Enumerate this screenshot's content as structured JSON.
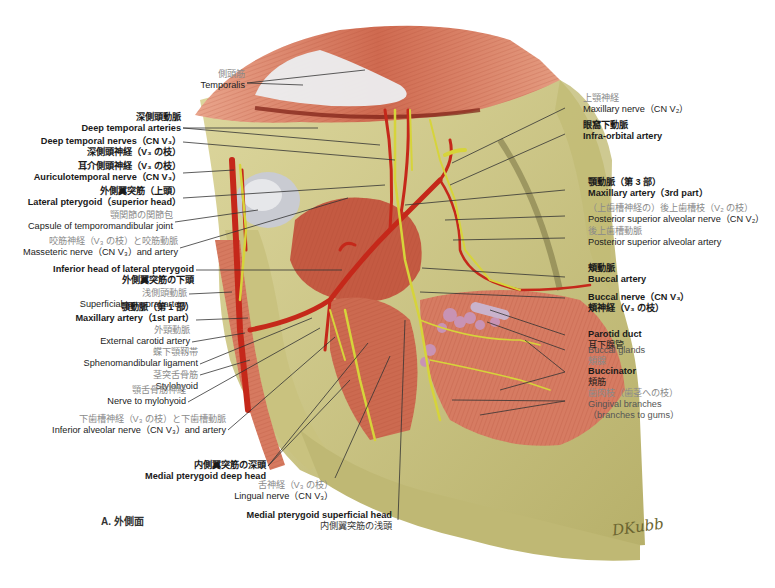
{
  "figure": {
    "caption": "A. 外側面",
    "signature": "DKubb",
    "title_hint": "Lateral view of infratemporal fossa: maxillary artery, mandibular nerve branches, pterygoid muscles"
  },
  "labels_left": [
    {
      "id": "temporalis",
      "jp": "側頭筋",
      "en": "Temporalis",
      "style": "normal"
    },
    {
      "id": "deep-temporal-arteries",
      "jp": "深側頭動脈",
      "en": "Deep temporal arteries",
      "style": "bold"
    },
    {
      "id": "deep-temporal-nerves",
      "en": "Deep temporal nerves（CN V₃）",
      "jp": "深側頭神経（V₃ の枝）",
      "style": "bold"
    },
    {
      "id": "auriculotemporal-nerve",
      "jp": "耳介側頭神経（V₃ の枝）",
      "en": "Auriculotemporal nerve（CN V₃）",
      "style": "bold"
    },
    {
      "id": "lateral-pterygoid-superior",
      "jp": "外側翼突筋（上頭）",
      "en": "Lateral pterygoid（superior head）",
      "style": "bold"
    },
    {
      "id": "tmj-capsule",
      "jp": "顎関節の関節包",
      "en": "Capsule of temporomandibular joint",
      "style": "normal"
    },
    {
      "id": "masseteric-nerve-artery",
      "jp": "咬筋神経（V₃ の枝）と咬筋動脈",
      "en": "Masseteric nerve（CN V₃）and artery",
      "style": "normal"
    },
    {
      "id": "lateral-pterygoid-inferior",
      "en": "Inferior head of lateral pterygoid",
      "jp": "外側翼突筋の下頭",
      "style": "bold"
    },
    {
      "id": "superficial-temporal-artery",
      "jp": "浅側頭動脈",
      "en": "Superficial temporal artery",
      "style": "inline"
    },
    {
      "id": "maxillary-artery-1st",
      "jp": "顎動脈（第 1 部）",
      "en": "Maxillary artery（1st part）",
      "style": "bold"
    },
    {
      "id": "external-carotid",
      "jp": "外頸動脈",
      "en": "External carotid artery",
      "style": "normal"
    },
    {
      "id": "sphenomandibular-ligament",
      "jp": "蝶下顎靱帯",
      "en": "Sphenomandibular ligament",
      "style": "normal"
    },
    {
      "id": "stylohyoid",
      "jp": "茎突舌骨筋",
      "en": "Stylohyoid",
      "style": "inline"
    },
    {
      "id": "nerve-to-mylohyoid",
      "jp": "顎舌骨筋神経",
      "en": "Nerve to mylohyoid",
      "style": "normal"
    },
    {
      "id": "inferior-alveolar",
      "jp": "下歯槽神経（V₃ の枝）と下歯槽動脈",
      "en": "Inferior alveolar nerve（CN V₃）and artery",
      "style": "normal"
    },
    {
      "id": "medial-pterygoid-deep",
      "jp": "内側翼突筋の深頭",
      "en": "Medial pterygoid deep head",
      "style": "inline-bold"
    },
    {
      "id": "lingual-nerve",
      "jp": "舌神経（V₃ の枝）",
      "en": "Lingual nerve（CN V₃）",
      "style": "inline"
    }
  ],
  "labels_bottom": [
    {
      "id": "medial-pterygoid-superficial",
      "en": "Medial pterygoid superficial head",
      "jp": "内側翼突筋の浅頭",
      "style": "bold-en"
    }
  ],
  "labels_right": [
    {
      "id": "maxillary-nerve",
      "jp": "上顎神経",
      "en": "Maxillary nerve（CN V₂）",
      "style": "normal"
    },
    {
      "id": "infraorbital-artery",
      "jp": "眼窩下動脈",
      "en": "Infra-orbital artery",
      "style": "bold"
    },
    {
      "id": "maxillary-artery-3rd",
      "jp": "顎動脈（第 3 部）",
      "en": "Maxillary artery（3rd part）",
      "style": "bold"
    },
    {
      "id": "posterior-superior-alveolar-nerve",
      "jp": "（上歯槽神経の）後上歯槽枝（V₂ の枝）",
      "en": "Posterior superior alveolar nerve（CN V₂）",
      "style": "normal"
    },
    {
      "id": "posterior-superior-alveolar-artery",
      "jp": "後上歯槽動脈",
      "en": "Posterior superior alveolar artery",
      "style": "normal"
    },
    {
      "id": "buccal-artery",
      "jp": "頬動脈",
      "en": "Buccal artery",
      "style": "bold"
    },
    {
      "id": "buccal-nerve",
      "en": "Buccal nerve（CN V₃）",
      "jp": "頬神経（V₃ の枝）",
      "style": "bold"
    },
    {
      "id": "parotid-duct",
      "en": "Parotid duct",
      "jp": "耳下腺管",
      "style": "inline-bold"
    },
    {
      "id": "buccal-glands",
      "en": "Buccal glands",
      "jp": "頬腺",
      "style": "inline"
    },
    {
      "id": "buccinator",
      "en": "Buccinator",
      "jp": "頬筋",
      "style": "inline-bold"
    },
    {
      "id": "gingival-branches",
      "jp": "歯肉枝（歯茎への枝）",
      "en": "Gingival branches",
      "en2": "（branches to gums）",
      "style": "normal"
    }
  ],
  "colors": {
    "bone": "#cfc88a",
    "bone_dark": "#a8a15c",
    "muscle": "#c9604a",
    "muscle_light": "#e59a82",
    "tendon": "#e6e6ea",
    "artery": "#c8291a",
    "nerve": "#d8d83a",
    "gland": "#c88fb0",
    "leader": "#333333"
  }
}
